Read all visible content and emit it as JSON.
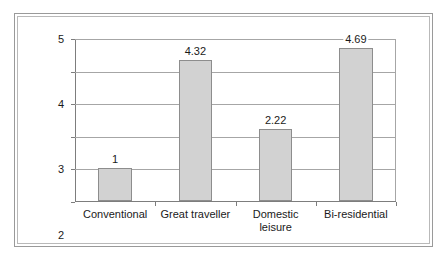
{
  "chart_data": {
    "type": "bar",
    "title": "",
    "xlabel": "",
    "ylabel": "",
    "categories": [
      "Conventional",
      "Great traveller",
      "Domestic\nleisure",
      "Bi-residential"
    ],
    "values": [
      1,
      4.32,
      2.22,
      4.69
    ],
    "value_labels": [
      "1",
      "4.32",
      "2.22",
      "4.69"
    ],
    "ylim": [
      0,
      5
    ],
    "yticks": [
      0,
      1,
      2,
      3,
      4,
      5
    ],
    "ytick_labels": [
      "0",
      "1",
      "2",
      "3",
      "4",
      "5"
    ],
    "grid": true,
    "legend": false,
    "bar_color": "#d2d2d2",
    "bar_border_color": "#8d8d8d",
    "gridline_color": "#a6a6a6",
    "axis_color": "#7d7d7d",
    "frame_color": "#9a9a9a",
    "background": "#ffffff"
  }
}
